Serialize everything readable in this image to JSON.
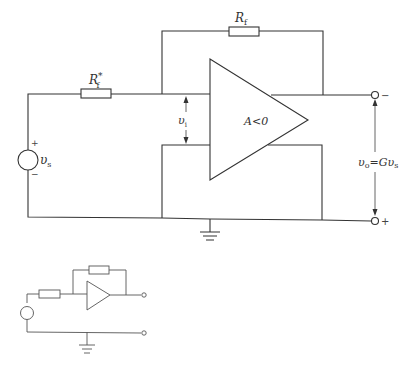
{
  "diagram": {
    "type": "circuit",
    "title": "",
    "main_circuit": {
      "components": {
        "feedback_resistor": {
          "label": "R",
          "subscript": "f"
        },
        "input_resistor": {
          "label": "R",
          "subscript": "f",
          "superscript": "*"
        },
        "source": {
          "label": "υ",
          "subscript": "s",
          "plus": "+",
          "minus": "−"
        },
        "amplifier": {
          "label": "A<0"
        },
        "input_voltage": {
          "label": "υ",
          "subscript": "i"
        },
        "output_voltage": {
          "label": "υ",
          "subscript": "o",
          "eq": "=Gυ",
          "eq_subscript": "s"
        },
        "output_terminal_top": {
          "sign": "−"
        },
        "output_terminal_bottom": {
          "sign": "+"
        },
        "ground": {
          "symbol": "ground-icon"
        }
      }
    },
    "thumbnail_circuit": {
      "description": "simplified inverting amplifier schematic"
    },
    "colors": {
      "line": "#333333",
      "background": "#ffffff"
    }
  }
}
